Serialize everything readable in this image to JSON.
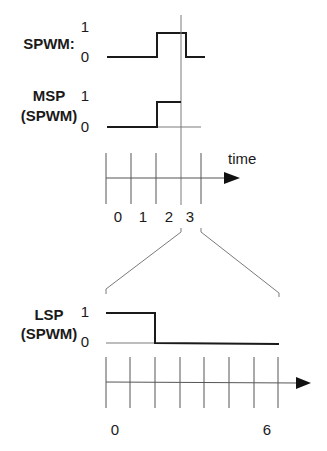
{
  "diagram": {
    "signals": {
      "spwm": {
        "label": "SPWM:",
        "high": "1",
        "low": "0"
      },
      "msp": {
        "label_line1": "MSP",
        "label_line2": "(SPWM)",
        "high": "1",
        "low": "0"
      },
      "lsp": {
        "label_line1": "LSP",
        "label_line2": "(SPWM)",
        "high": "1",
        "low": "0"
      }
    },
    "top_timeline": {
      "axis_label": "time",
      "tick_labels": [
        "0",
        "1",
        "2",
        "3"
      ]
    },
    "bottom_timeline": {
      "tick_labels": [
        "0",
        "6"
      ]
    }
  }
}
